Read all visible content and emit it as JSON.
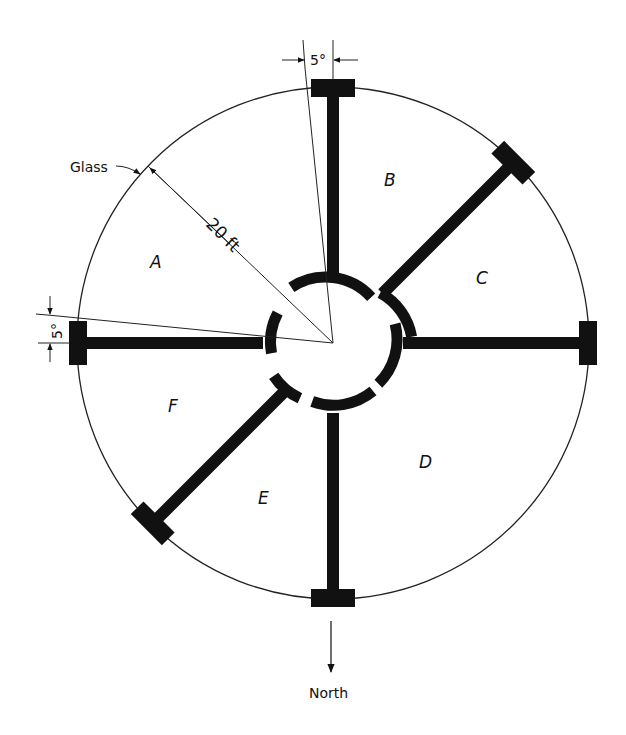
{
  "labels": {
    "glass": "Glass",
    "radius": "20 ft",
    "angle_top": "5°",
    "angle_left": "5°",
    "north": "North"
  },
  "zones": [
    {
      "id": "A",
      "label": "A"
    },
    {
      "id": "B",
      "label": "B"
    },
    {
      "id": "C",
      "label": "C"
    },
    {
      "id": "D",
      "label": "D"
    },
    {
      "id": "E",
      "label": "E"
    },
    {
      "id": "F",
      "label": "F"
    }
  ],
  "colors": {
    "ink": "#111111",
    "paper": "#ffffff"
  }
}
